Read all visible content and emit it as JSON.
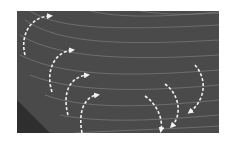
{
  "figure": {
    "colors": {
      "background": "#ffffff",
      "panel": "#4a4a4a",
      "corner_shadow": "#2e2e2e",
      "streamline": "#8a8a8a",
      "arrow": "#f2f2f2"
    },
    "arrows_left": [
      {
        "id": 1,
        "path": "M25 55 C20 35, 30 17, 50 16",
        "head": [
          53,
          16
        ],
        "direction": "right"
      },
      {
        "id": 2,
        "path": "M52 92 C45 70, 55 52, 72 50",
        "head": [
          75,
          50
        ],
        "direction": "right"
      },
      {
        "id": 3,
        "path": "M68 115 C62 92, 70 77, 87 75",
        "head": [
          90,
          75
        ],
        "direction": "right"
      },
      {
        "id": 4,
        "path": "M82 133 C78 112, 84 97, 97 95",
        "head": [
          100,
          95
        ],
        "direction": "right"
      }
    ],
    "arrows_right": [
      {
        "id": 5,
        "path": "M195 65 C208 80, 205 100, 190 112",
        "head": [
          188,
          113
        ],
        "direction": "down-left"
      },
      {
        "id": 6,
        "path": "M165 84 C180 95, 182 115, 172 126",
        "head": [
          170,
          127
        ],
        "direction": "down-left"
      },
      {
        "id": 7,
        "path": "M145 96 C158 105, 163 120, 161 130",
        "head": [
          160,
          132
        ],
        "direction": "down"
      }
    ]
  }
}
